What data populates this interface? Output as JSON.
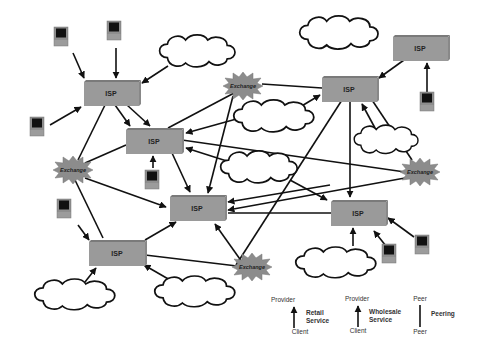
{
  "diagram": {
    "type": "network-topology",
    "nodes": {
      "isp": [
        {
          "id": "isp1",
          "label": "ISP",
          "x": 84,
          "y": 80,
          "w": 55,
          "h": 25
        },
        {
          "id": "isp2",
          "label": "ISP",
          "x": 126,
          "y": 128,
          "w": 56,
          "h": 25
        },
        {
          "id": "isp3",
          "label": "ISP",
          "x": 170,
          "y": 195,
          "w": 55,
          "h": 25
        },
        {
          "id": "isp4",
          "label": "ISP",
          "x": 89,
          "y": 240,
          "w": 56,
          "h": 25
        },
        {
          "id": "isp5",
          "label": "ISP",
          "x": 322,
          "y": 76,
          "w": 55,
          "h": 25
        },
        {
          "id": "isp6",
          "label": "ISP",
          "x": 393,
          "y": 35,
          "w": 55,
          "h": 25
        },
        {
          "id": "isp7",
          "label": "ISP",
          "x": 331,
          "y": 200,
          "w": 55,
          "h": 25
        }
      ],
      "exchanges": [
        {
          "id": "ex1",
          "label": "Exchange",
          "x": 243,
          "y": 86
        },
        {
          "id": "ex2",
          "label": "Exchange",
          "x": 73,
          "y": 170
        },
        {
          "id": "ex3",
          "label": "Exchange",
          "x": 420,
          "y": 172
        },
        {
          "id": "ex4",
          "label": "Exchange",
          "x": 252,
          "y": 267
        }
      ]
    },
    "legend": {
      "retail": {
        "top": "Provider",
        "bottom": "Client",
        "label_line1": "Retail",
        "label_line2": "Service"
      },
      "wholesale": {
        "top": "Provider",
        "bottom": "Client",
        "label_line1": "Wholesale",
        "label_line2": "Service"
      },
      "peering": {
        "top": "Peer",
        "bottom": "Peer",
        "label": "Peering"
      }
    },
    "colors": {
      "isp_fill": "#9a9a9a",
      "isp_top": "#7a7a7a",
      "exchange_fill": "#8c8c8c",
      "line": "#111111",
      "monitor_screen": "#111111",
      "monitor_body": "#8e8e8e"
    }
  }
}
